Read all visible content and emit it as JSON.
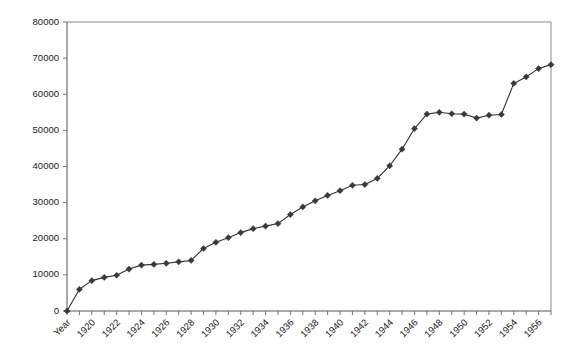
{
  "chart_data": {
    "type": "line",
    "title": "",
    "subtitle": "",
    "xlabel": "",
    "ylabel": "",
    "ylim": [
      0,
      80000
    ],
    "ytick_step": 10000,
    "yticks": [
      "0",
      "10000",
      "20000",
      "30000",
      "40000",
      "50000",
      "60000",
      "70000",
      "80000"
    ],
    "grid": false,
    "legend": false,
    "legend_position": "none",
    "marker": "diamond",
    "line_color": "#333333",
    "marker_color": "#3a3a3a",
    "axis_color": "#555555",
    "frame_color": "#8a8a8a",
    "background_color": "#ffffff",
    "xtick_label_rotation_deg": -45,
    "xtick_labels_visible": [
      "Year",
      "1920",
      "1922",
      "1924",
      "1926",
      "1928",
      "1930",
      "1932",
      "1934",
      "1936",
      "1938",
      "1940",
      "1942",
      "1944",
      "1946",
      "1948",
      "1950",
      "1952",
      "1954",
      "1956"
    ],
    "categories": [
      "Year",
      "1919",
      "1920",
      "1921",
      "1922",
      "1923",
      "1924",
      "1925",
      "1926",
      "1927",
      "1928",
      "1929",
      "1930",
      "1931",
      "1932",
      "1933",
      "1934",
      "1935",
      "1936",
      "1937",
      "1938",
      "1939",
      "1940",
      "1941",
      "1942",
      "1943",
      "1944",
      "1945",
      "1946",
      "1947",
      "1948",
      "1949",
      "1950",
      "1951",
      "1952",
      "1953",
      "1954",
      "1955",
      "1956",
      "1957"
    ],
    "values": [
      0,
      6000,
      8400,
      9300,
      9900,
      11600,
      12700,
      12900,
      13200,
      13600,
      14000,
      17300,
      19000,
      20300,
      21700,
      22800,
      23500,
      24200,
      26700,
      28800,
      30500,
      32000,
      33300,
      34800,
      35000,
      36700,
      40200,
      44800,
      50500,
      54500,
      55000,
      54600,
      54500,
      53400,
      54200,
      54400,
      63000,
      64800,
      67100,
      68200
    ],
    "series": [
      {
        "name": "Series 1",
        "values": [
          0,
          6000,
          8400,
          9300,
          9900,
          11600,
          12700,
          12900,
          13200,
          13600,
          14000,
          17300,
          19000,
          20300,
          21700,
          22800,
          23500,
          24200,
          26700,
          28800,
          30500,
          32000,
          33300,
          34800,
          35000,
          36700,
          40200,
          44800,
          50500,
          54500,
          55000,
          54600,
          54500,
          53400,
          54200,
          54400,
          63000,
          64800,
          67100,
          68200
        ]
      }
    ]
  }
}
